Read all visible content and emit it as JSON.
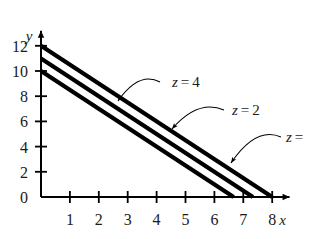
{
  "chart_data": {
    "type": "line",
    "title": "",
    "subtitle": "",
    "xlabel": "x",
    "ylabel": "y",
    "xlim": [
      0,
      8.6
    ],
    "ylim": [
      0,
      13.2
    ],
    "xticks": [
      1,
      2,
      3,
      4,
      5,
      6,
      7,
      8
    ],
    "yticks": [
      0,
      2,
      4,
      6,
      8,
      10,
      12
    ],
    "xtick_labels": [
      "1",
      "2",
      "3",
      "4",
      "5",
      "6",
      "7",
      "8"
    ],
    "ytick_labels": [
      "0",
      "2",
      "4",
      "6",
      "8",
      "10",
      "12"
    ],
    "grid": false,
    "legend": "none",
    "axis_arrows": true,
    "line_color": "#000000",
    "series": [
      {
        "name": "z = 4",
        "label": "z = 4",
        "label_var": "z",
        "label_rel": "=",
        "label_value": "4",
        "x": [
          0,
          8
        ],
        "y": [
          12,
          0
        ],
        "x_intercept": 8,
        "y_intercept": 12,
        "slope": -1.5,
        "leader_from": [
          160,
          82
        ],
        "leader_to": [
          118,
          101
        ],
        "label_at": [
          172,
          87
        ]
      },
      {
        "name": "z = 2",
        "label": "z = 2",
        "label_var": "z",
        "label_rel": "=",
        "label_value": "2",
        "x": [
          0,
          7.3333
        ],
        "y": [
          11,
          0
        ],
        "x_intercept": 7.3333,
        "y_intercept": 11,
        "slope": -1.5,
        "leader_from": [
          224,
          110
        ],
        "leader_to": [
          172,
          129
        ],
        "label_at": [
          232,
          115
        ]
      },
      {
        "name": "z = 0",
        "label": "z =",
        "label_var": "z",
        "label_rel": "=",
        "label_value": "",
        "x": [
          0,
          6.6667
        ],
        "y": [
          10,
          0
        ],
        "x_intercept": 6.6667,
        "y_intercept": 10,
        "slope": -1.5,
        "leader_from": [
          281,
          137
        ],
        "leader_to": [
          231,
          163
        ],
        "label_at": [
          286,
          142
        ]
      }
    ],
    "annotations": [
      {
        "text": "z = 4",
        "target_series": "z = 4"
      },
      {
        "text": "z = 2",
        "target_series": "z = 2"
      },
      {
        "text": "z =",
        "target_series": "z = 0",
        "clipped": true
      }
    ]
  }
}
